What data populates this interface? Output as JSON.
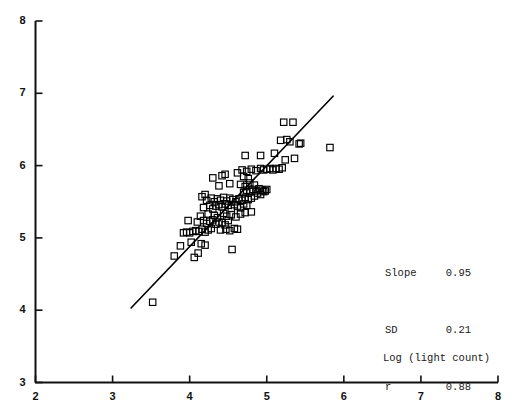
{
  "chart_data": {
    "type": "scatter",
    "title": "",
    "xlabel": "Log (light count)",
    "ylabel": "",
    "xlim": [
      2,
      8
    ],
    "ylim": [
      3,
      8
    ],
    "xticks": [
      2,
      3,
      4,
      5,
      6,
      7,
      8
    ],
    "yticks": [
      3,
      4,
      5,
      6,
      7,
      8
    ],
    "xtick_labels": [
      "2",
      "3",
      "4",
      "5",
      "6",
      "7",
      "8"
    ],
    "ytick_labels": [
      "3",
      "4",
      "5",
      "6",
      "7",
      "8"
    ],
    "grid": false,
    "legend": null,
    "marker": "open-square",
    "marker_color": "#000000",
    "point_count": 126,
    "points": [
      [
        3.52,
        4.11
      ],
      [
        3.8,
        4.75
      ],
      [
        3.88,
        4.89
      ],
      [
        4.02,
        4.94
      ],
      [
        4.06,
        4.73
      ],
      [
        4.11,
        4.79
      ],
      [
        4.15,
        4.92
      ],
      [
        4.2,
        4.9
      ],
      [
        4.55,
        4.84
      ],
      [
        3.92,
        5.07
      ],
      [
        3.96,
        5.08
      ],
      [
        4.0,
        5.07
      ],
      [
        4.04,
        5.09
      ],
      [
        4.08,
        5.1
      ],
      [
        4.12,
        5.09
      ],
      [
        4.16,
        5.12
      ],
      [
        4.2,
        5.08
      ],
      [
        4.24,
        5.11
      ],
      [
        4.28,
        5.13
      ],
      [
        4.4,
        5.11
      ],
      [
        4.47,
        5.12
      ],
      [
        4.52,
        5.1
      ],
      [
        4.58,
        5.13
      ],
      [
        4.62,
        5.12
      ],
      [
        4.1,
        5.22
      ],
      [
        4.18,
        5.24
      ],
      [
        4.22,
        5.2
      ],
      [
        3.98,
        5.24
      ],
      [
        4.26,
        5.23
      ],
      [
        4.3,
        5.25
      ],
      [
        4.34,
        5.19
      ],
      [
        4.38,
        5.22
      ],
      [
        4.42,
        5.21
      ],
      [
        4.46,
        5.18
      ],
      [
        4.5,
        5.24
      ],
      [
        4.14,
        5.3
      ],
      [
        4.24,
        5.33
      ],
      [
        4.32,
        5.31
      ],
      [
        4.36,
        5.28
      ],
      [
        4.44,
        5.34
      ],
      [
        4.48,
        5.3
      ],
      [
        4.54,
        5.32
      ],
      [
        4.6,
        5.29
      ],
      [
        4.66,
        5.33
      ],
      [
        4.72,
        5.35
      ],
      [
        4.8,
        5.36
      ],
      [
        4.18,
        5.42
      ],
      [
        4.26,
        5.45
      ],
      [
        4.3,
        5.4
      ],
      [
        4.34,
        5.44
      ],
      [
        4.38,
        5.46
      ],
      [
        4.42,
        5.43
      ],
      [
        4.46,
        5.47
      ],
      [
        4.5,
        5.45
      ],
      [
        4.54,
        5.41
      ],
      [
        4.58,
        5.46
      ],
      [
        4.62,
        5.44
      ],
      [
        4.66,
        5.42
      ],
      [
        4.7,
        5.47
      ],
      [
        4.74,
        5.45
      ],
      [
        4.22,
        5.52
      ],
      [
        4.28,
        5.55
      ],
      [
        4.32,
        5.5
      ],
      [
        4.36,
        5.54
      ],
      [
        4.4,
        5.52
      ],
      [
        4.44,
        5.56
      ],
      [
        4.48,
        5.51
      ],
      [
        4.52,
        5.55
      ],
      [
        4.56,
        5.53
      ],
      [
        4.6,
        5.5
      ],
      [
        4.64,
        5.54
      ],
      [
        4.68,
        5.52
      ],
      [
        4.72,
        5.56
      ],
      [
        4.76,
        5.53
      ],
      [
        4.8,
        5.55
      ],
      [
        4.16,
        5.57
      ],
      [
        4.2,
        5.6
      ],
      [
        4.84,
        5.58
      ],
      [
        4.88,
        5.62
      ],
      [
        4.92,
        5.6
      ],
      [
        4.96,
        5.64
      ],
      [
        4.7,
        5.63
      ],
      [
        4.74,
        5.66
      ],
      [
        4.78,
        5.64
      ],
      [
        4.82,
        5.67
      ],
      [
        4.86,
        5.65
      ],
      [
        4.9,
        5.68
      ],
      [
        4.94,
        5.66
      ],
      [
        4.98,
        5.65
      ],
      [
        5.0,
        5.67
      ],
      [
        4.38,
        5.72
      ],
      [
        4.52,
        5.75
      ],
      [
        4.66,
        5.74
      ],
      [
        4.72,
        5.71
      ],
      [
        4.78,
        5.76
      ],
      [
        4.84,
        5.73
      ],
      [
        4.3,
        5.83
      ],
      [
        4.42,
        5.86
      ],
      [
        4.46,
        5.88
      ],
      [
        4.7,
        5.85
      ],
      [
        4.76,
        5.82
      ],
      [
        4.62,
        5.9
      ],
      [
        4.68,
        5.94
      ],
      [
        4.74,
        5.92
      ],
      [
        4.8,
        5.95
      ],
      [
        4.86,
        5.93
      ],
      [
        4.92,
        5.96
      ],
      [
        4.96,
        5.94
      ],
      [
        5.0,
        5.95
      ],
      [
        5.04,
        5.96
      ],
      [
        5.08,
        5.94
      ],
      [
        5.12,
        5.96
      ],
      [
        5.16,
        5.95
      ],
      [
        5.2,
        5.97
      ],
      [
        5.24,
        6.08
      ],
      [
        5.36,
        6.1
      ],
      [
        4.72,
        6.14
      ],
      [
        4.92,
        6.14
      ],
      [
        5.1,
        6.17
      ],
      [
        5.18,
        6.35
      ],
      [
        5.26,
        6.36
      ],
      [
        5.3,
        6.33
      ],
      [
        5.42,
        6.3
      ],
      [
        5.44,
        6.31
      ],
      [
        5.22,
        6.6
      ],
      [
        5.34,
        6.6
      ],
      [
        5.82,
        6.25
      ]
    ],
    "fit_line": {
      "x_start": 3.24,
      "y_start": 4.03,
      "x_end": 5.86,
      "y_end": 6.96,
      "color": "#000000"
    },
    "annotations": {
      "slope_label": "Slope",
      "slope_value": "0.95",
      "sd_label": "SD",
      "sd_value": "0.21",
      "r_label": "r",
      "r_value": "0.88"
    }
  }
}
